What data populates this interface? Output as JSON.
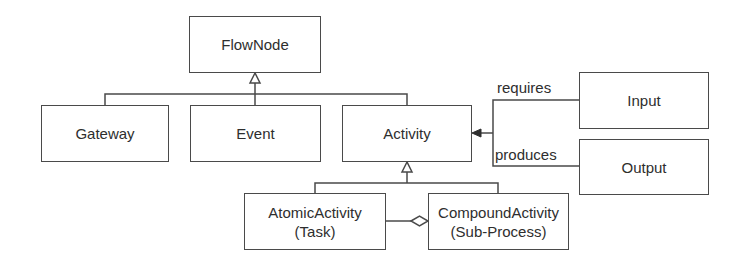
{
  "diagram": {
    "type": "uml-class-diagram",
    "nodes": {
      "flownode": {
        "label": "FlowNode"
      },
      "gateway": {
        "label": "Gateway"
      },
      "event": {
        "label": "Event"
      },
      "activity": {
        "label": "Activity"
      },
      "input": {
        "label": "Input"
      },
      "output": {
        "label": "Output"
      },
      "atomic": {
        "line1": "AtomicActivity",
        "line2": "(Task)"
      },
      "compound": {
        "line1": "CompoundActivity",
        "line2": "(Sub-Process)"
      }
    },
    "edges": {
      "requires": {
        "label": "requires",
        "from": "Activity",
        "to": "Input"
      },
      "produces": {
        "label": "produces",
        "from": "Activity",
        "to": "Output"
      }
    },
    "relations": [
      {
        "kind": "generalization",
        "child": "Gateway",
        "parent": "FlowNode"
      },
      {
        "kind": "generalization",
        "child": "Event",
        "parent": "FlowNode"
      },
      {
        "kind": "generalization",
        "child": "Activity",
        "parent": "FlowNode"
      },
      {
        "kind": "generalization",
        "child": "AtomicActivity (Task)",
        "parent": "Activity"
      },
      {
        "kind": "generalization",
        "child": "CompoundActivity (Sub-Process)",
        "parent": "Activity"
      },
      {
        "kind": "aggregation",
        "whole": "CompoundActivity (Sub-Process)",
        "part": "AtomicActivity (Task)"
      },
      {
        "kind": "association",
        "label": "requires",
        "between": [
          "Activity",
          "Input"
        ]
      },
      {
        "kind": "association",
        "label": "produces",
        "between": [
          "Activity",
          "Output"
        ]
      }
    ],
    "colors": {
      "line": "#4a4a4a",
      "text": "#2e2e2e",
      "background": "#ffffff"
    }
  }
}
